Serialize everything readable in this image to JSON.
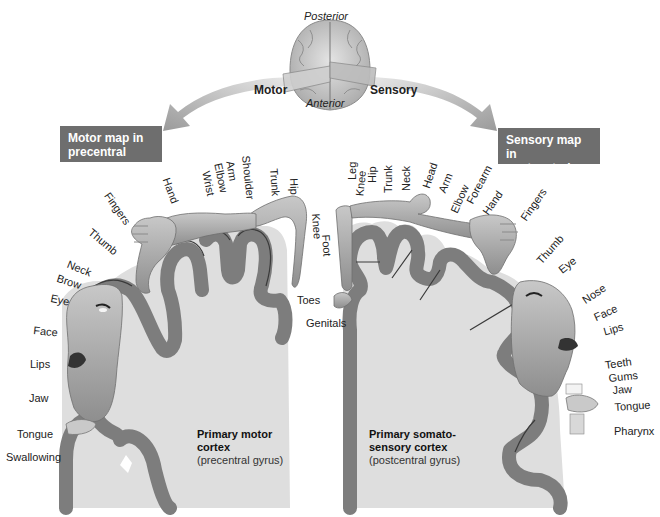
{
  "top": {
    "posterior": "Posterior",
    "anterior": "Anterior",
    "motor": "Motor",
    "sensory": "Sensory"
  },
  "boxes": {
    "motor_map": [
      "Motor map in",
      "precentral gyrus"
    ],
    "sensory_map": [
      "Sensory map in",
      "postcentral gyrus"
    ]
  },
  "motor_labels": {
    "hand": "Hand",
    "wrist": "Wrist",
    "elbow": "Elbow",
    "arm": "Arm",
    "shoulder": "Shoulder",
    "trunk": "Trunk",
    "hip": "Hip",
    "knee": "Knee",
    "foot": "Foot",
    "toes": "Toes",
    "fingers": "Fingers",
    "thumb": "Thumb",
    "neck": "Neck",
    "brow": "Brow",
    "eye": "Eye",
    "face": "Face",
    "lips": "Lips",
    "jaw": "Jaw",
    "tongue": "Tongue",
    "swallowing": "Swallowing"
  },
  "sensory_labels": {
    "genitals": "Genitals",
    "knee": "Knee",
    "leg": "Leg",
    "hip": "Hip",
    "trunk": "Trunk",
    "neck": "Neck",
    "head": "Head",
    "arm": "Arm",
    "elbow": "Elbow",
    "forearm": "Forearm",
    "hand": "Hand",
    "fingers": "Fingers",
    "thumb": "Thumb",
    "eye": "Eye",
    "nose": "Nose",
    "face": "Face",
    "lips": "Lips",
    "teeth": "Teeth",
    "gums": "Gums",
    "jaw": "Jaw",
    "tongue": "Tongue",
    "pharynx": "Pharynx"
  },
  "captions": {
    "motor": {
      "title1": "Primary motor",
      "title2": "cortex",
      "sub": "(precentral gyrus)"
    },
    "sensory": {
      "title1": "Primary somato-",
      "title2": "sensory cortex",
      "sub": "(postcentral gyrus)"
    }
  },
  "colors": {
    "label_box": "#6e6e6e",
    "gray_matter": "#7d7d7d",
    "white_matter": "#dcdcdc",
    "skin": "#b3b3b3",
    "arrow": "#a8a8a8",
    "background": "#ffffff"
  }
}
